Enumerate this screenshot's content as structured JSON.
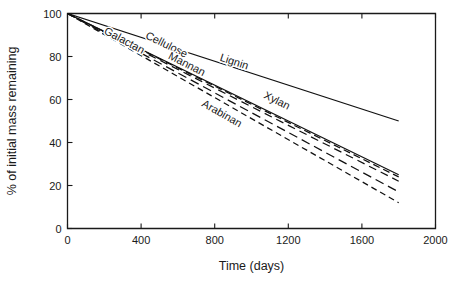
{
  "chart_data": {
    "type": "line",
    "title": "",
    "subtitle": "",
    "xlabel": "Time (days)",
    "ylabel": "% of initial mass remaining",
    "xlim": [
      0,
      2000
    ],
    "ylim": [
      0,
      100
    ],
    "xticks": [
      0,
      400,
      800,
      1200,
      1600,
      2000
    ],
    "xticklabels": [
      "0",
      "400",
      "800",
      "1200",
      "1600",
      "2000"
    ],
    "yticks": [
      0,
      20,
      40,
      60,
      80,
      100
    ],
    "yticklabels": [
      "0",
      "20",
      "40",
      "60",
      "80",
      "100"
    ],
    "grid": false,
    "legend": "inline-labels",
    "series": [
      {
        "name": "Lignin",
        "style": "solid",
        "color": "#111111",
        "x": [
          0,
          1800
        ],
        "values": [
          100,
          50
        ],
        "label_x": 900,
        "label_y": 76
      },
      {
        "name": "Xylan",
        "style": "solid",
        "color": "#111111",
        "x": [
          0,
          1800
        ],
        "values": [
          100,
          25
        ],
        "label_x": 1130,
        "label_y": 58
      },
      {
        "name": "Cellulose",
        "style": "dashed",
        "color": "#111111",
        "x": [
          0,
          1800
        ],
        "values": [
          100,
          24
        ],
        "label_x": 530,
        "label_y": 84
      },
      {
        "name": "Mannan",
        "style": "dashed",
        "color": "#111111",
        "x": [
          0,
          1800
        ],
        "values": [
          100,
          22
        ],
        "label_x": 640,
        "label_y": 75
      },
      {
        "name": "Galactan",
        "style": "dashed",
        "color": "#111111",
        "x": [
          0,
          1800
        ],
        "values": [
          100,
          17
        ],
        "label_x": 300,
        "label_y": 86
      },
      {
        "name": "Arabinan",
        "style": "dashed",
        "color": "#111111",
        "x": [
          0,
          1800
        ],
        "values": [
          100,
          12
        ],
        "label_x": 830,
        "label_y": 52
      }
    ]
  },
  "axes": {
    "x_title": "Time (days)",
    "y_title": "% of initial mass remaining"
  }
}
